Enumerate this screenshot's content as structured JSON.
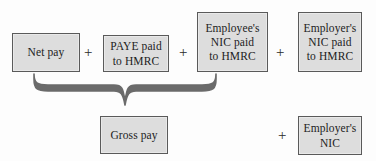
{
  "diagram": {
    "colors": {
      "box_fill": "#dddddd",
      "box_border": "#5a5a5a",
      "text": "#1c1c1c",
      "brace": "#6b6b6b",
      "background": "#fdfdfd"
    },
    "top_row": {
      "boxes": [
        {
          "id": "net-pay",
          "label": "Net pay"
        },
        {
          "id": "paye-paid-to-hmrc",
          "label": "PAYE paid\nto HMRC"
        },
        {
          "id": "employee-nic-paid-to-hmrc",
          "label": "Employee's\nNIC paid\nto HMRC"
        },
        {
          "id": "employer-nic-paid-to-hmrc",
          "label": "Employer's\nNIC paid\nto HMRC"
        }
      ],
      "operators": [
        "+",
        "+",
        "+"
      ]
    },
    "bottom_row": {
      "boxes": [
        {
          "id": "gross-pay",
          "label": "Gross pay"
        },
        {
          "id": "employer-nic",
          "label": "Employer's\nNIC"
        }
      ],
      "operators": [
        "+"
      ]
    },
    "brace": {
      "id": "grouping-brace",
      "groups": [
        "net-pay",
        "paye-paid-to-hmrc",
        "employee-nic-paid-to-hmrc"
      ],
      "points_to": "gross-pay"
    }
  }
}
